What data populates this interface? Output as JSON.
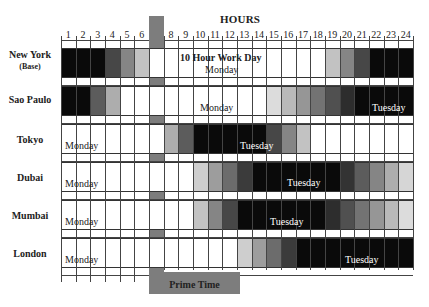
{
  "chart_data": {
    "type": "heatmap",
    "title": "HOURS",
    "xlabel": "HOURS",
    "ylabel": "",
    "categories": [
      1,
      2,
      3,
      4,
      5,
      6,
      7,
      8,
      9,
      10,
      11,
      12,
      13,
      14,
      15,
      16,
      17,
      18,
      19,
      20,
      21,
      22,
      23,
      24
    ],
    "highlight_column": 7,
    "highlight_label": "Prime Time",
    "annotation": "10 Hour Work Day",
    "series": [
      {
        "name": "New York",
        "subtitle": "(Base)",
        "dark_hours": [
          1,
          2,
          3,
          22,
          23,
          24
        ],
        "fade_out": [
          4,
          6
        ],
        "fade_in": [
          19,
          21
        ],
        "day_labels": [
          {
            "text": "Monday",
            "hour": 10.5
          }
        ]
      },
      {
        "name": "Sao Paulo",
        "dark_hours": [
          1,
          2,
          21,
          22,
          23,
          24
        ],
        "fade_out": [
          3,
          4
        ],
        "fade_in": [
          15,
          20
        ],
        "day_labels": [
          {
            "text": "Monday",
            "hour": 10
          },
          {
            "text": "Tuesday",
            "hour": 22.5
          }
        ]
      },
      {
        "name": "Tokyo",
        "dark_hours": [
          10,
          11,
          12,
          13,
          14
        ],
        "fade_in": [
          8,
          9
        ],
        "fade_out": [
          15,
          17
        ],
        "day_labels": [
          {
            "text": "Monday",
            "hour": 1
          },
          {
            "text": "Tuesday",
            "hour": 13
          }
        ]
      },
      {
        "name": "Dubai",
        "dark_hours": [
          14,
          15,
          16,
          17,
          18,
          19
        ],
        "fade_in": [
          10,
          13
        ],
        "fade_out": [
          20,
          24
        ],
        "day_labels": [
          {
            "text": "Monday",
            "hour": 1
          },
          {
            "text": "Tuesday",
            "hour": 16
          }
        ]
      },
      {
        "name": "Mumbai",
        "dark_hours": [
          13,
          14,
          15,
          16,
          17,
          18
        ],
        "fade_in": [
          10,
          12
        ],
        "fade_out": [
          19,
          24
        ],
        "day_labels": [
          {
            "text": "Monday",
            "hour": 1
          },
          {
            "text": "Tuesday",
            "hour": 15
          }
        ]
      },
      {
        "name": "London",
        "dark_hours": [
          17,
          18,
          19,
          20,
          21,
          22,
          23,
          24
        ],
        "fade_in": [
          13,
          16
        ],
        "day_labels": [
          {
            "text": "Monday",
            "hour": 1
          },
          {
            "text": "Tuesday",
            "hour": 21
          }
        ]
      }
    ],
    "grid": true,
    "legend": "none"
  },
  "labels": {
    "title": "HOURS",
    "work_day": "10 Hour Work Day",
    "prime_time": "Prime Time",
    "monday": "Monday",
    "tuesday": "Tuesday",
    "ticks": [
      "1",
      "2",
      "3",
      "4",
      "5",
      "6",
      "7",
      "8",
      "9",
      "10",
      "11",
      "12",
      "13",
      "14",
      "15",
      "16",
      "17",
      "18",
      "19",
      "20",
      "21",
      "22",
      "23",
      "24"
    ],
    "cities": [
      {
        "name": "New York",
        "sub": "(Base)"
      },
      {
        "name": "Sao Paulo",
        "sub": ""
      },
      {
        "name": "Tokyo",
        "sub": ""
      },
      {
        "name": "Dubai",
        "sub": ""
      },
      {
        "name": "Mumbai",
        "sub": ""
      },
      {
        "name": "London",
        "sub": ""
      }
    ]
  },
  "colors": {
    "dark": "#0a0a0a",
    "highlight": "#7d7d7d",
    "grid": "#444444"
  }
}
